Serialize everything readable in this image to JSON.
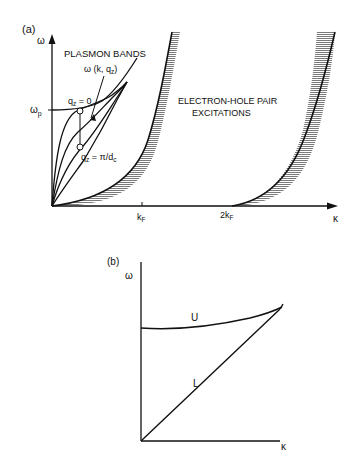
{
  "panel_a": {
    "label": "(a)",
    "y_axis_label": "ω",
    "x_axis_label": "κ",
    "omega_p_label": "ω",
    "omega_p_sub": "p",
    "title": "PLASMON BANDS",
    "band_label": "ω (k, q",
    "band_label_sub": "z",
    "band_label_close": ")",
    "qz0_label": "q",
    "qz0_sub": "z",
    "qz0_value": " = 0",
    "qzpi_label": "q",
    "qzpi_sub": "z",
    "qzpi_value": " = π/d",
    "qzpi_value_sub": "c",
    "region_label_line1": "ELECTRON-HOLE PAIR",
    "region_label_line2": "EXCITATIONS",
    "tick_kf": "k",
    "tick_kf_sub": "F",
    "tick_2kf": "2k",
    "tick_2kf_sub": "F"
  },
  "panel_b": {
    "label": "(b)",
    "y_axis_label": "ω",
    "x_axis_label": "κ",
    "upper_branch": "U",
    "lower_branch": "L"
  },
  "colors": {
    "ink": "#111111",
    "hatch": "#8a8a8a",
    "background": "#ffffff"
  }
}
